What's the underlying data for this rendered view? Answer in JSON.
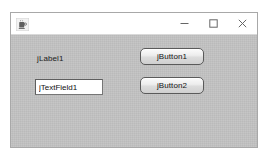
{
  "window": {
    "title": "",
    "icon": "java-coffee-cup-icon",
    "controls": {
      "minimize_label": "–",
      "maximize_label": "☐",
      "close_label": "×"
    }
  },
  "form": {
    "label": {
      "text": "jLabel1"
    },
    "text_field": {
      "value": "jTextField1",
      "placeholder": ""
    },
    "buttons": [
      {
        "label": "jButton1"
      },
      {
        "label": "jButton2"
      }
    ]
  },
  "colors": {
    "panel_background": "#c2c2c2",
    "title_bar_background": "#ffffff",
    "window_border": "#a8a8a8",
    "text": "#1b1b1b",
    "field_background": "#ffffff",
    "field_border": "#767676",
    "button_border": "#5a5a5a"
  }
}
